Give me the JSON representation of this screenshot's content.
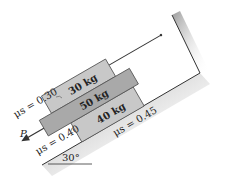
{
  "diagram": {
    "incline_angle_label": "30°",
    "force_label": "P",
    "blocks": [
      {
        "id": "top",
        "label": "30 kg",
        "color": "#c8c8c8"
      },
      {
        "id": "middle",
        "label": "50 kg",
        "color": "#a9a9a9"
      },
      {
        "id": "bottom",
        "label": "40 kg",
        "color": "#c8c8c8"
      }
    ],
    "friction": [
      {
        "between": "30kg-50kg",
        "label": "μs = 0.30"
      },
      {
        "between": "50kg-40kg",
        "label": "μs = 0.40"
      },
      {
        "between": "40kg-incline",
        "label": "μs = 0.45"
      }
    ],
    "colors": {
      "block_light": "#c8c8c8",
      "block_dark": "#a9a9a9",
      "outline": "#333333",
      "shade": "#bdbdbd"
    }
  }
}
